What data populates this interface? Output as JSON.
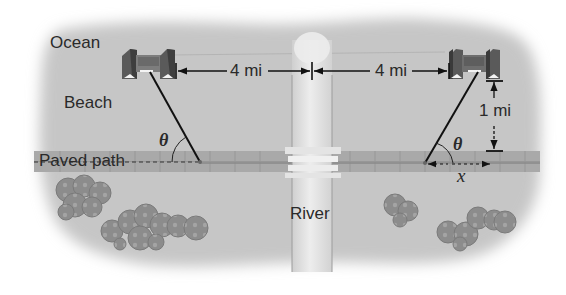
{
  "diagram": {
    "type": "word-problem illustration",
    "colors": {
      "land": "#c8c8c8",
      "path": "#a8a8a8",
      "river": "#e2e2e2",
      "building_dark": "#4a4a4a",
      "building_mid": "#8a8a8a",
      "lines": "#111111",
      "bushes": "#8e8e8e"
    },
    "region_labels": {
      "ocean": "Ocean",
      "beach": "Beach",
      "paved_path": "Paved path",
      "river": "River"
    },
    "dimensions": {
      "left_distance": "4 mi",
      "right_distance": "4 mi",
      "vertical_distance": "1 mi"
    },
    "variables": {
      "angle_left": "θ",
      "angle_right": "θ",
      "horizontal_offset": "x"
    },
    "objects": [
      {
        "name": "left-building",
        "position": "upper-left"
      },
      {
        "name": "right-building",
        "position": "upper-right"
      },
      {
        "name": "river",
        "position": "center-vertical"
      },
      {
        "name": "bridge",
        "position": "river-path-crossing"
      },
      {
        "name": "bush-cluster-1",
        "position": "lower-left"
      },
      {
        "name": "bush-cluster-2",
        "position": "lower-left-center"
      },
      {
        "name": "bush-cluster-3",
        "position": "lower-right-center"
      },
      {
        "name": "bush-cluster-4",
        "position": "lower-right"
      }
    ]
  }
}
